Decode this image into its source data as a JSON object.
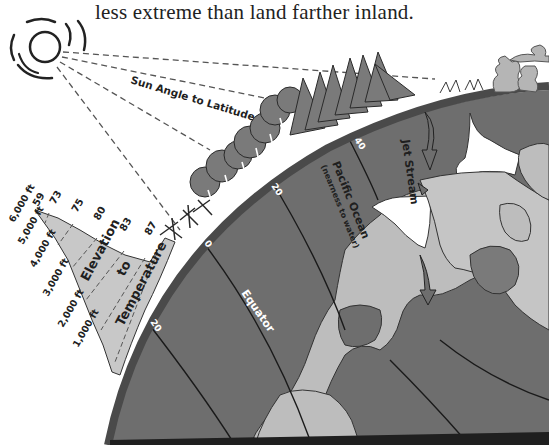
{
  "caption": "less extreme than land farther inland.",
  "labels": {
    "sun_angle": "Sun Angle to Latitude",
    "elevation_line1": "Elevation",
    "elevation_line2": "to",
    "elevation_line3": "Temperature",
    "pacific_ocean": "Pacific Ocean",
    "pacific_ocean_sub": "(nearness to water)",
    "jet_stream": "Jet Stream",
    "equator": "Equator"
  },
  "latitude_marks": [
    "0",
    "20",
    "20",
    "40"
  ],
  "elevations": [
    "6,000 ft",
    "5,000 ft",
    "4,000 ft",
    "3,000 ft",
    "2,000 ft",
    "1,000 ft"
  ],
  "temperatures": [
    "59",
    "73",
    "75",
    "80",
    "83",
    "87"
  ],
  "colors": {
    "ocean": "#6e6e6e",
    "land": "#bdbdbd",
    "ice": "#ffffff",
    "rim": "#4a4a4a",
    "mountain": "#c8c8c8",
    "tree": "#7a7a7a",
    "ink": "#1f1f1f"
  }
}
